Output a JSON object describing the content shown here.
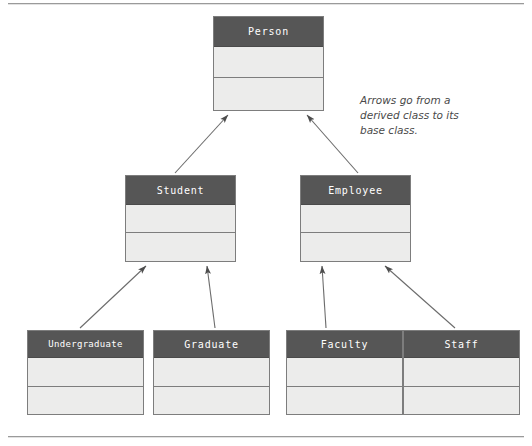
{
  "page": {
    "background_color": "#ffffff",
    "rule_color": "#9a9a9a"
  },
  "theme": {
    "class_header_fill": "#565656",
    "class_header_text": "#ffffff",
    "class_body_fill": "#ececeb",
    "class_border": "#7d7d7d",
    "arrow_color": "#6b6b6b",
    "annotation_color": "#4a4a4a"
  },
  "diagram": {
    "type": "uml-class-diagram",
    "classes": [
      {
        "id": "person",
        "name": "Person",
        "level": 0,
        "compartments": [
          "",
          ""
        ]
      },
      {
        "id": "student",
        "name": "Student",
        "level": 1,
        "compartments": [
          "",
          ""
        ]
      },
      {
        "id": "employee",
        "name": "Employee",
        "level": 1,
        "compartments": [
          "",
          ""
        ]
      },
      {
        "id": "undergraduate",
        "name": "Undergraduate",
        "level": 2,
        "compartments": [
          "",
          ""
        ]
      },
      {
        "id": "graduate",
        "name": "Graduate",
        "level": 2,
        "compartments": [
          "",
          ""
        ]
      },
      {
        "id": "faculty",
        "name": "Faculty",
        "level": 2,
        "compartments": [
          "",
          ""
        ]
      },
      {
        "id": "staff",
        "name": "Staff",
        "level": 2,
        "compartments": [
          "",
          ""
        ]
      }
    ],
    "relationships": [
      {
        "from": "student",
        "to": "person",
        "kind": "inheritance"
      },
      {
        "from": "employee",
        "to": "person",
        "kind": "inheritance"
      },
      {
        "from": "undergraduate",
        "to": "student",
        "kind": "inheritance"
      },
      {
        "from": "graduate",
        "to": "student",
        "kind": "inheritance"
      },
      {
        "from": "faculty",
        "to": "employee",
        "kind": "inheritance"
      },
      {
        "from": "staff",
        "to": "employee",
        "kind": "inheritance"
      }
    ]
  },
  "annotation": {
    "line1": "Arrows go from a",
    "line2": "derived class to its",
    "line3": "base class."
  }
}
